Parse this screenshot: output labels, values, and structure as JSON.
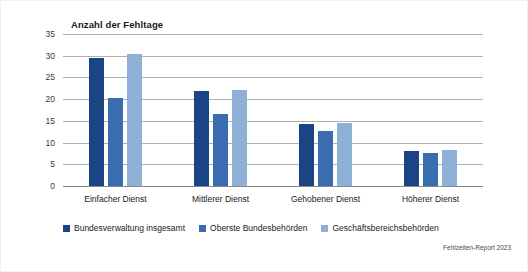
{
  "chart_data": {
    "type": "bar",
    "title": "Anzahl der Fehltage",
    "xlabel": "",
    "ylabel": "",
    "ylim": [
      0,
      35
    ],
    "yticks": [
      0,
      5,
      10,
      15,
      20,
      25,
      30,
      35
    ],
    "ytick_labels": [
      "0",
      "5",
      "10",
      "15",
      "20",
      "25",
      "30",
      "35"
    ],
    "grid": true,
    "legend_position": "bottom-left",
    "categories": [
      "Einfacher Dienst",
      "Mittlerer Dienst",
      "Gehobener Dienst",
      "Höherer Dienst"
    ],
    "series": [
      {
        "name": "Bundesverwaltung insgesamt",
        "color": "#1a4484",
        "values": [
          29.5,
          21.9,
          14.3,
          8.1
        ]
      },
      {
        "name": "Oberste Bundesbehörden",
        "color": "#3a6cb0",
        "values": [
          20.3,
          16.6,
          12.7,
          7.6
        ]
      },
      {
        "name": "Geschäftsbereichsbehörden",
        "color": "#8fb0d6",
        "values": [
          30.3,
          22.2,
          14.4,
          8.3
        ]
      }
    ],
    "source_note": "Fehlzeiten-Report 2023"
  }
}
